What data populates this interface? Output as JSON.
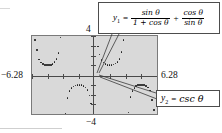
{
  "figure": {
    "kind": "graphing-calculator-screen",
    "background_color": "#ffffff",
    "screen_color": "#d9d9d9",
    "trace_color": "#1b1b1b"
  },
  "axis_labels": {
    "x_min": "−6.28",
    "x_max": "6.28",
    "y_max": "4",
    "y_min": "−4"
  },
  "callouts": [
    {
      "id": "y1",
      "name": "y1-equation-callout",
      "lhs": "y",
      "sub": "1",
      "equals": "=",
      "term1": {
        "numerator": "sin θ",
        "denominator": "1 + cos θ"
      },
      "plus": "+",
      "term2": {
        "numerator": "cos θ",
        "denominator": "sin θ"
      },
      "plain_text": "y₁ = sin θ / (1 + cos θ) + cos θ / sin θ"
    },
    {
      "id": "y2",
      "name": "y2-equation-callout",
      "lhs": "y",
      "sub": "2",
      "equals": "=",
      "rhs": "csc θ",
      "plain_text": "y₂ = csc θ"
    }
  ],
  "chart_data": {
    "type": "scatter",
    "title": "",
    "xlabel": "",
    "ylabel": "",
    "xlim": [
      -6.28,
      6.28
    ],
    "ylim": [
      -4,
      4
    ],
    "grid": false,
    "legend": [
      "y1 = sin θ/(1 + cos θ) + cos θ/sin θ",
      "y2 = csc θ"
    ],
    "annotations": [
      "y₁ = sin θ / (1 + cos θ) + cos θ / sin θ",
      "y₂ = csc θ"
    ],
    "note": "Dotted plot of csc θ over [-6.28, 6.28]; the two expressions coincide, showing the identity.",
    "x_ticks": [
      -6.28,
      -4.71,
      -3.14,
      -1.57,
      0,
      1.57,
      3.14,
      4.71,
      6.28
    ],
    "y_ticks": [
      -4,
      -3,
      -2,
      -1,
      0,
      1,
      2,
      3,
      4
    ],
    "series": [
      {
        "name": "y = csc θ",
        "points": [
          [
            -6.0,
            3.6
          ],
          [
            -5.8,
            2.56
          ],
          [
            -5.6,
            1.58
          ],
          [
            -5.4,
            1.3
          ],
          [
            -5.2,
            1.13
          ],
          [
            -5.0,
            1.04
          ],
          [
            -4.8,
            1.0
          ],
          [
            -4.6,
            1.0
          ],
          [
            -4.4,
            1.04
          ],
          [
            -4.2,
            1.13
          ],
          [
            -4.0,
            1.32
          ],
          [
            -3.8,
            1.62
          ],
          [
            -3.6,
            2.26
          ],
          [
            -3.4,
            3.84
          ],
          [
            -2.9,
            -4.0
          ],
          [
            -2.7,
            -2.33
          ],
          [
            -2.5,
            -1.67
          ],
          [
            -2.3,
            -1.34
          ],
          [
            -2.1,
            -1.16
          ],
          [
            -1.9,
            -1.06
          ],
          [
            -1.7,
            -1.0
          ],
          [
            -1.5,
            -1.0
          ],
          [
            -1.3,
            -1.04
          ],
          [
            -1.1,
            -1.12
          ],
          [
            -0.9,
            -1.28
          ],
          [
            -0.7,
            -1.55
          ],
          [
            -0.5,
            -2.09
          ],
          [
            -0.35,
            -2.91
          ],
          [
            0.35,
            2.91
          ],
          [
            0.5,
            2.09
          ],
          [
            0.7,
            1.55
          ],
          [
            0.9,
            1.28
          ],
          [
            1.1,
            1.12
          ],
          [
            1.3,
            1.04
          ],
          [
            1.5,
            1.0
          ],
          [
            1.7,
            1.0
          ],
          [
            1.9,
            1.06
          ],
          [
            2.1,
            1.16
          ],
          [
            2.3,
            1.34
          ],
          [
            2.5,
            1.67
          ],
          [
            2.7,
            2.33
          ],
          [
            2.9,
            3.57
          ],
          [
            3.4,
            -3.84
          ],
          [
            3.6,
            -2.26
          ],
          [
            3.8,
            -1.62
          ],
          [
            4.0,
            -1.32
          ],
          [
            4.2,
            -1.13
          ],
          [
            4.4,
            -1.04
          ],
          [
            4.6,
            -1.0
          ],
          [
            4.8,
            -1.0
          ],
          [
            5.0,
            -1.04
          ],
          [
            5.2,
            -1.13
          ],
          [
            5.4,
            -1.3
          ],
          [
            5.6,
            -1.58
          ],
          [
            5.8,
            -2.56
          ],
          [
            6.0,
            -3.6
          ]
        ]
      }
    ]
  }
}
